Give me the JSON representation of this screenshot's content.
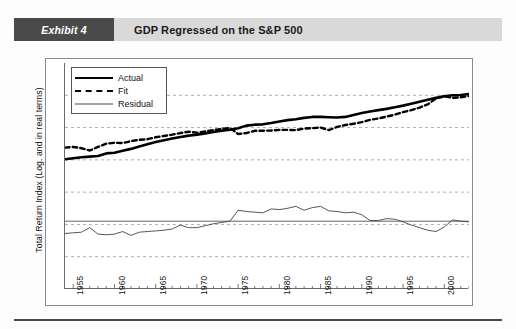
{
  "header": {
    "exhibit_tag": "Exhibit 4",
    "title": "GDP Regressed on the S&P 500"
  },
  "chart_data": {
    "type": "line",
    "title": "GDP Regressed on the S&P 500",
    "xlabel": "",
    "ylabel": "Total Return Index (Log. and in real terms)",
    "xlim": [
      1954,
      2003
    ],
    "xticks": [
      1955,
      1960,
      1965,
      1970,
      1975,
      1980,
      1985,
      1990,
      1995,
      2000
    ],
    "xtick_labels": [
      "1955",
      "1960",
      "1965",
      "1970",
      "1975",
      "1980",
      "1985",
      "1990",
      "1995",
      "2000"
    ],
    "minor_ticks_per_interval": 4,
    "grid": true,
    "grid_style": "dashed-horizontal",
    "ytick_count": 7,
    "ylim": [
      0,
      7
    ],
    "y_gridlines": [
      1,
      2,
      3,
      4,
      5,
      6
    ],
    "legend_position": "top-left",
    "legend": [
      "Actual",
      "Fit",
      "Residual"
    ],
    "series": [
      {
        "name": "Actual",
        "style": "solid-thick",
        "color": "#000000",
        "x": [
          1954,
          1955,
          1956,
          1957,
          1958,
          1959,
          1960,
          1961,
          1962,
          1963,
          1964,
          1965,
          1966,
          1967,
          1968,
          1969,
          1970,
          1971,
          1972,
          1973,
          1974,
          1975,
          1976,
          1977,
          1978,
          1979,
          1980,
          1981,
          1982,
          1983,
          1984,
          1985,
          1986,
          1987,
          1988,
          1989,
          1990,
          1991,
          1992,
          1993,
          1994,
          1995,
          1996,
          1997,
          1998,
          1999,
          2000,
          2001,
          2002,
          2003
        ],
        "y": [
          4.02,
          4.05,
          4.08,
          4.1,
          4.12,
          4.2,
          4.22,
          4.28,
          4.34,
          4.41,
          4.48,
          4.55,
          4.61,
          4.66,
          4.71,
          4.75,
          4.78,
          4.82,
          4.86,
          4.9,
          4.93,
          4.98,
          5.06,
          5.09,
          5.1,
          5.14,
          5.19,
          5.23,
          5.26,
          5.3,
          5.33,
          5.33,
          5.32,
          5.31,
          5.33,
          5.39,
          5.45,
          5.5,
          5.54,
          5.58,
          5.63,
          5.68,
          5.74,
          5.8,
          5.86,
          5.92,
          5.97,
          6.0,
          6.01,
          6.04
        ]
      },
      {
        "name": "Fit",
        "style": "dashed",
        "color": "#000000",
        "x": [
          1954,
          1955,
          1956,
          1957,
          1958,
          1959,
          1960,
          1961,
          1962,
          1963,
          1964,
          1965,
          1966,
          1967,
          1968,
          1969,
          1970,
          1971,
          1972,
          1973,
          1974,
          1975,
          1976,
          1977,
          1978,
          1979,
          1980,
          1981,
          1982,
          1983,
          1984,
          1985,
          1986,
          1987,
          1988,
          1989,
          1990,
          1991,
          1992,
          1993,
          1994,
          1995,
          1996,
          1997,
          1998,
          1999,
          2000,
          2001,
          2002,
          2003
        ],
        "y": [
          4.38,
          4.4,
          4.36,
          4.29,
          4.4,
          4.5,
          4.53,
          4.52,
          4.58,
          4.62,
          4.64,
          4.7,
          4.74,
          4.78,
          4.83,
          4.87,
          4.84,
          4.88,
          4.92,
          4.96,
          4.99,
          4.8,
          4.83,
          4.9,
          4.9,
          4.91,
          4.93,
          4.93,
          4.92,
          4.97,
          4.98,
          5.0,
          4.92,
          5.02,
          5.08,
          5.12,
          5.17,
          5.24,
          5.28,
          5.34,
          5.4,
          5.48,
          5.54,
          5.62,
          5.72,
          5.9,
          5.97,
          5.92,
          5.94,
          5.98
        ]
      },
      {
        "name": "Residual",
        "style": "solid-thin",
        "color": "#444444",
        "zero_level": 2.1,
        "x": [
          1954,
          1955,
          1956,
          1957,
          1958,
          1959,
          1960,
          1961,
          1962,
          1963,
          1964,
          1965,
          1966,
          1967,
          1968,
          1969,
          1970,
          1971,
          1972,
          1973,
          1974,
          1975,
          1976,
          1977,
          1978,
          1979,
          1980,
          1981,
          1982,
          1983,
          1984,
          1985,
          1986,
          1987,
          1988,
          1989,
          1990,
          1991,
          1992,
          1993,
          1994,
          1995,
          1996,
          1997,
          1998,
          1999,
          2000,
          2001,
          2002,
          2003
        ],
        "y": [
          1.72,
          1.74,
          1.76,
          1.9,
          1.7,
          1.68,
          1.7,
          1.78,
          1.66,
          1.76,
          1.78,
          1.8,
          1.82,
          1.86,
          1.98,
          1.9,
          1.9,
          1.96,
          2.02,
          2.06,
          2.1,
          2.44,
          2.4,
          2.38,
          2.36,
          2.48,
          2.46,
          2.5,
          2.56,
          2.44,
          2.52,
          2.56,
          2.42,
          2.4,
          2.36,
          2.38,
          2.3,
          2.12,
          2.12,
          2.18,
          2.16,
          2.08,
          1.98,
          1.9,
          1.82,
          1.78,
          1.92,
          2.14,
          2.1,
          2.08
        ]
      }
    ]
  }
}
